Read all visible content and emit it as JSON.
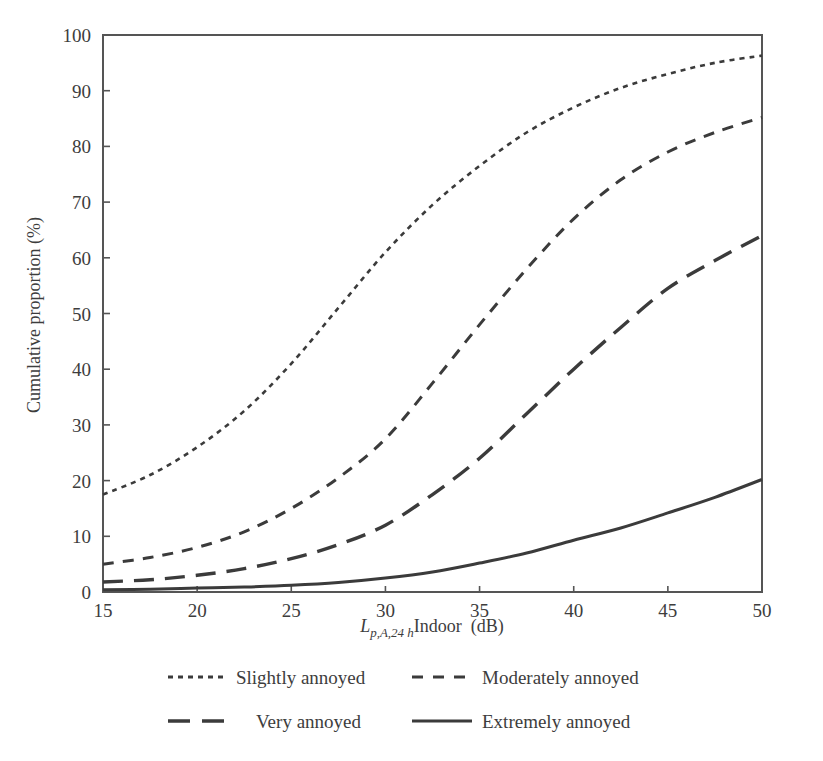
{
  "chart_data": {
    "type": "line",
    "title": "",
    "subtitle": "",
    "xlabel": "L p,A,24 h Indoor (dB)",
    "xlabel_parts": {
      "base": "L",
      "subscript": "p,A,24 h",
      "rest": "Indoor  (dB)"
    },
    "ylabel": "Cumulative proportion (%)",
    "xlim": [
      15,
      50
    ],
    "ylim": [
      0,
      100
    ],
    "xticks": [
      15,
      20,
      25,
      30,
      35,
      40,
      45,
      50
    ],
    "yticks": [
      0,
      10,
      20,
      30,
      40,
      50,
      60,
      70,
      80,
      90,
      100
    ],
    "xtick_labels": [
      "15",
      "20",
      "25",
      "30",
      "35",
      "40",
      "45",
      "50"
    ],
    "ytick_labels": [
      "0",
      "10",
      "20",
      "30",
      "40",
      "50",
      "60",
      "70",
      "80",
      "90",
      "100"
    ],
    "grid": false,
    "legend_position": "below-axes",
    "x": [
      15,
      17.5,
      20,
      22.5,
      25,
      27.5,
      30,
      32.5,
      35,
      37.5,
      40,
      42.5,
      45,
      47.5,
      50
    ],
    "series": [
      {
        "name": "Slightly annoyed",
        "dash": "dotted",
        "color": "#3b3b3b",
        "stroke_width": 2.6,
        "dasharray": "5,5",
        "values": [
          17.5,
          21.0,
          26.0,
          32.5,
          41.0,
          51.0,
          61.0,
          69.5,
          76.5,
          82.5,
          87.0,
          90.5,
          93.0,
          95.0,
          96.3
        ]
      },
      {
        "name": "Moderately annoyed",
        "dash": "dashed",
        "color": "#3b3b3b",
        "stroke_width": 3.0,
        "dasharray": "11,9",
        "values": [
          5.0,
          6.2,
          8.0,
          10.8,
          15.0,
          20.5,
          27.5,
          37.5,
          48.0,
          58.0,
          67.0,
          74.0,
          79.0,
          82.5,
          85.2
        ]
      },
      {
        "name": "Very annoyed",
        "dash": "long-dash",
        "color": "#3b3b3b",
        "stroke_width": 3.4,
        "dasharray": "20,11",
        "values": [
          1.8,
          2.2,
          3.0,
          4.2,
          6.0,
          8.5,
          12.0,
          17.5,
          24.0,
          32.0,
          40.0,
          47.5,
          54.5,
          59.5,
          64.0
        ]
      },
      {
        "name": "Extremely annoyed",
        "dash": "solid",
        "color": "#3b3b3b",
        "stroke_width": 3.0,
        "dasharray": "none",
        "values": [
          0.4,
          0.5,
          0.7,
          0.9,
          1.2,
          1.7,
          2.5,
          3.6,
          5.2,
          7.0,
          9.3,
          11.5,
          14.2,
          17.0,
          20.2
        ]
      }
    ]
  },
  "legend": {
    "entries": [
      {
        "label": "Slightly annoyed"
      },
      {
        "label": "Moderately annoyed"
      },
      {
        "label": "Very annoyed"
      },
      {
        "label": "Extremely annoyed"
      }
    ]
  }
}
